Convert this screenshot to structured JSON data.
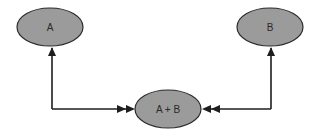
{
  "diagram": {
    "type": "node-link",
    "colors": {
      "background": "#ffffff",
      "node_fill": "#9b9b9b",
      "node_stroke": "#2a2a2a",
      "edge": "#1e1e1e",
      "label": "#2a2a2a"
    },
    "nodes": [
      {
        "id": "A",
        "label": "A",
        "shape": "ellipse",
        "cx": 50,
        "cy": 27,
        "rx": 33,
        "ry": 19
      },
      {
        "id": "B",
        "label": "B",
        "shape": "ellipse",
        "cx": 270,
        "cy": 27,
        "rx": 33,
        "ry": 19
      },
      {
        "id": "AB",
        "label": "A + B",
        "shape": "ellipse",
        "cx": 168,
        "cy": 109,
        "rx": 33,
        "ry": 19
      }
    ],
    "edges": [
      {
        "from": "A",
        "to": "AB",
        "routing": "orthogonal",
        "arrow_at_A": "single",
        "arrow_at_AB": "double"
      },
      {
        "from": "B",
        "to": "AB",
        "routing": "orthogonal",
        "arrow_at_B": "single",
        "arrow_at_AB": "double"
      }
    ]
  }
}
